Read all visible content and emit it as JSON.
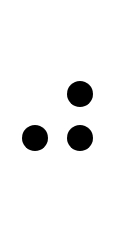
{
  "canvas": {
    "width": 120,
    "height": 168,
    "background": "#ffffff"
  },
  "dots": [
    {
      "name": "top-right",
      "cx": 80,
      "cy": 94,
      "diameter": 26,
      "color": "#000000"
    },
    {
      "name": "bottom-left",
      "cx": 35,
      "cy": 138,
      "diameter": 26,
      "color": "#000000"
    },
    {
      "name": "bottom-right",
      "cx": 80,
      "cy": 138,
      "diameter": 26,
      "color": "#000000"
    }
  ]
}
